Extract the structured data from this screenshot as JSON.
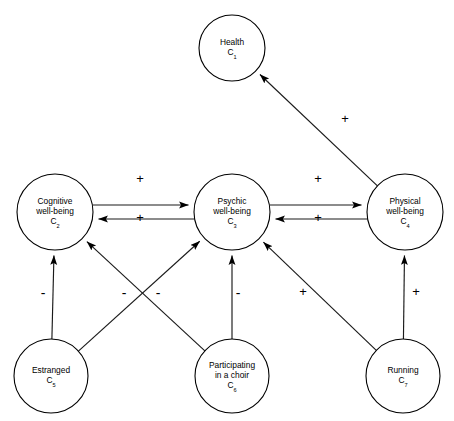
{
  "diagram": {
    "type": "fuzzy-cognitive-map",
    "background_color": "#ffffff",
    "stroke_color": "#000000",
    "width": 454,
    "height": 421
  },
  "nodes": [
    {
      "id": "C1",
      "label_lines": [
        "Health"
      ],
      "concept": "C",
      "index": "1",
      "cx": 232,
      "cy": 48,
      "r": 33
    },
    {
      "id": "C2",
      "label_lines": [
        "Cognitive",
        "well-being"
      ],
      "concept": "C",
      "index": "2",
      "cx": 55,
      "cy": 212,
      "r": 38
    },
    {
      "id": "C3",
      "label_lines": [
        "Psychic",
        "well-being"
      ],
      "concept": "C",
      "index": "3",
      "cx": 232,
      "cy": 212,
      "r": 38
    },
    {
      "id": "C4",
      "label_lines": [
        "Physical",
        "well-being"
      ],
      "concept": "C",
      "index": "4",
      "cx": 405,
      "cy": 212,
      "r": 38
    },
    {
      "id": "C5",
      "label_lines": [
        "Estranged"
      ],
      "concept": "C",
      "index": "5",
      "cx": 51,
      "cy": 376,
      "r": 37
    },
    {
      "id": "C6",
      "label_lines": [
        "Participating",
        "in a choir"
      ],
      "concept": "C",
      "index": "6",
      "cx": 232,
      "cy": 376,
      "r": 37
    },
    {
      "id": "C7",
      "label_lines": [
        "Running"
      ],
      "concept": "C",
      "index": "7",
      "cx": 403,
      "cy": 376,
      "r": 37
    }
  ],
  "edges": [
    {
      "name": "edge-physical-to-health",
      "from": "C4",
      "to": "C1",
      "sign": "+",
      "sign_x": 345,
      "sign_y": 120
    },
    {
      "name": "edge-cognitive-to-psychic",
      "from": "C2",
      "to": "C3",
      "sign": "+",
      "sign_x": 140,
      "sign_y": 180
    },
    {
      "name": "edge-psychic-to-cognitive",
      "from": "C3",
      "to": "C2",
      "sign": "+",
      "sign_x": 140,
      "sign_y": 219
    },
    {
      "name": "edge-psychic-to-physical",
      "from": "C3",
      "to": "C4",
      "sign": "+",
      "sign_x": 318,
      "sign_y": 180
    },
    {
      "name": "edge-physical-to-psychic",
      "from": "C4",
      "to": "C3",
      "sign": "+",
      "sign_x": 318,
      "sign_y": 219
    },
    {
      "name": "edge-estranged-to-cognitive",
      "from": "C5",
      "to": "C2",
      "sign": "-",
      "sign_x": 43,
      "sign_y": 294
    },
    {
      "name": "edge-estranged-to-psychic",
      "from": "C5",
      "to": "C3",
      "sign": "-",
      "sign_x": 124,
      "sign_y": 294
    },
    {
      "name": "edge-choir-to-cognitive",
      "from": "C6",
      "to": "C2",
      "sign": "-",
      "sign_x": 158,
      "sign_y": 294
    },
    {
      "name": "edge-choir-to-psychic",
      "from": "C6",
      "to": "C3",
      "sign": "-",
      "sign_x": 238,
      "sign_y": 294
    },
    {
      "name": "edge-running-to-psychic",
      "from": "C7",
      "to": "C3",
      "sign": "+",
      "sign_x": 303,
      "sign_y": 293
    },
    {
      "name": "edge-running-to-physical",
      "from": "C7",
      "to": "C4",
      "sign": "+",
      "sign_x": 416,
      "sign_y": 293
    }
  ]
}
